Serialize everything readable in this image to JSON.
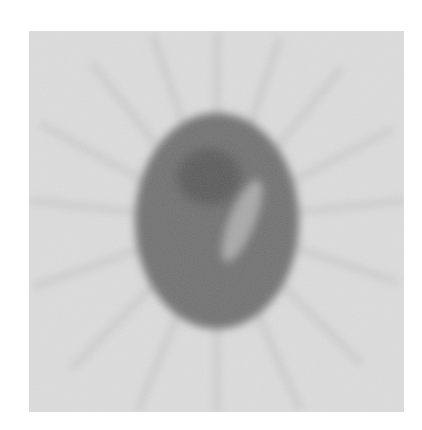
{
  "image": {
    "subject": "reconstructed tomographic phantom slice",
    "background_color": "#dedede",
    "ellipse_color": "#717171",
    "dark_region_color": "#5a5a5a",
    "bright_region_color": "#a9a9a9",
    "streak_color": "#cfcfcf"
  }
}
